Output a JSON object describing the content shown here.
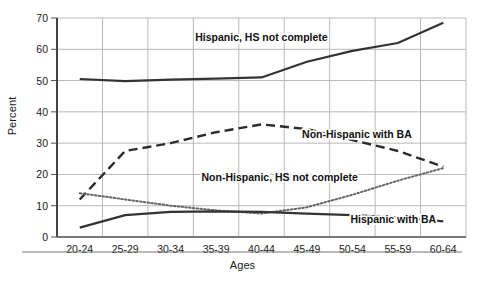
{
  "chart_data": {
    "type": "line",
    "title": "",
    "xlabel": "Ages",
    "ylabel": "Percent",
    "categories": [
      "20-24",
      "25-29",
      "30-34",
      "35-39",
      "40-44",
      "45-49",
      "50-54",
      "55-59",
      "60-64"
    ],
    "ylim": [
      0,
      70
    ],
    "yticks": [
      0,
      10,
      20,
      30,
      40,
      50,
      60,
      70
    ],
    "grid": true,
    "legend_position": "inline-annotations",
    "series": [
      {
        "name": "Hispanic, HS not complete",
        "style": "solid",
        "color": "#333333",
        "values": [
          50.5,
          49.8,
          50.3,
          50.6,
          51.0,
          56.0,
          59.5,
          62.0,
          68.5
        ]
      },
      {
        "name": "Non-Hispanic with BA",
        "style": "dashed",
        "color": "#2b2b2b",
        "values": [
          12.0,
          27.5,
          30.0,
          33.5,
          36.0,
          34.5,
          31.0,
          27.5,
          22.5
        ]
      },
      {
        "name": "Non-Hispanic, HS not complete",
        "style": "dotted",
        "color": "#666666",
        "values": [
          14.0,
          12.0,
          10.0,
          8.5,
          7.5,
          9.5,
          13.5,
          18.0,
          22.0
        ]
      },
      {
        "name": "Hispanic with BA",
        "style": "solid",
        "color": "#333333",
        "values": [
          3.0,
          7.0,
          8.0,
          8.2,
          8.0,
          7.5,
          7.0,
          6.3,
          5.0
        ]
      }
    ],
    "annotations": [
      {
        "text": "Hispanic, HS not complete",
        "x": 4.0,
        "y": 62.5
      },
      {
        "text": "Non-Hispanic with BA",
        "x": 6.1,
        "y": 31.5
      },
      {
        "text": "Non-Hispanic, HS not complete",
        "x": 4.4,
        "y": 18.0
      },
      {
        "text": "Hispanic with BA",
        "x": 6.9,
        "y": 4.5
      }
    ]
  },
  "axis": {
    "ylabel": "Percent",
    "xlabel": "Ages",
    "ytick_labels": [
      "0",
      "10",
      "20",
      "30",
      "40",
      "50",
      "60",
      "70"
    ],
    "xtick_labels": [
      "20-24",
      "25-29",
      "30-34",
      "35-39",
      "40-44",
      "45-49",
      "50-54",
      "55-59",
      "60-64"
    ]
  },
  "colors": {
    "grid": "#b8b8b8",
    "axis": "#555555",
    "ink": "#1a1a1a"
  }
}
